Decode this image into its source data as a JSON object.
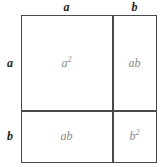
{
  "diagram": {
    "type": "area-model",
    "colors": {
      "line": "#4a4a4a",
      "cell_label": "#8a8a8a",
      "edge_label": "#1d1d1d",
      "background": "#ffffff"
    },
    "edge_labels": {
      "top_left": "a",
      "top_right": "b",
      "left_top": "a",
      "left_bottom": "b"
    },
    "cells": [
      {
        "name": "top-left",
        "base": "a",
        "exponent": "2",
        "text": "a2"
      },
      {
        "name": "top-right",
        "base": "ab",
        "exponent": "",
        "text": "ab"
      },
      {
        "name": "bottom-left",
        "base": "ab",
        "exponent": "",
        "text": "ab"
      },
      {
        "name": "bottom-right",
        "base": "b",
        "exponent": "2",
        "text": "b2"
      }
    ]
  }
}
